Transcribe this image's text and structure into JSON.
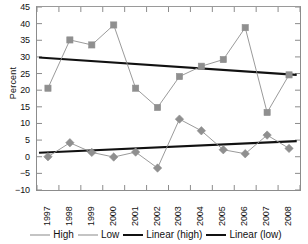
{
  "chart_data": {
    "type": "line",
    "title": "",
    "xlabel": "",
    "ylabel": "Percent",
    "x": [
      "1997",
      "1998",
      "1999",
      "2000",
      "2001",
      "2002",
      "2003",
      "2004",
      "2005",
      "2006",
      "2007",
      "2008"
    ],
    "ylim": [
      -10,
      45
    ],
    "yticks": [
      "45",
      "40",
      "35",
      "30",
      "25",
      "20",
      "15",
      "10",
      "5",
      "0",
      "-5",
      "-10"
    ],
    "ytick_values": [
      45,
      40,
      35,
      30,
      25,
      20,
      15,
      10,
      5,
      0,
      -5,
      -10
    ],
    "grid": false,
    "legend_position": "bottom",
    "series": [
      {
        "name": "High",
        "marker": "square",
        "color": "#8f8f8f",
        "values": [
          20.6,
          35.1,
          33.6,
          39.6,
          20.6,
          14.8,
          24.1,
          27.2,
          29.2,
          38.8,
          13.3,
          24.6
        ]
      },
      {
        "name": "Low",
        "marker": "diamond",
        "color": "#8f8f8f",
        "values": [
          0.0,
          4.2,
          1.3,
          -0.1,
          1.4,
          -3.4,
          11.3,
          7.8,
          2.1,
          0.9,
          6.5,
          2.5
        ]
      },
      {
        "name": "Linear (high)",
        "marker": "none",
        "color": "#111111",
        "trend": true,
        "endpoints": [
          29.8,
          24.6
        ]
      },
      {
        "name": "Linear (low)",
        "marker": "none",
        "color": "#111111",
        "trend": true,
        "endpoints": [
          1.2,
          4.7
        ]
      }
    ]
  },
  "legend": {
    "items": [
      {
        "label": "High",
        "style": "thin"
      },
      {
        "label": "Low",
        "style": "thin"
      },
      {
        "label": "Linear (high)",
        "style": "thick"
      },
      {
        "label": "Linear (low)",
        "style": "thick"
      }
    ]
  },
  "axes": {
    "y_axis_title": "Percent"
  }
}
